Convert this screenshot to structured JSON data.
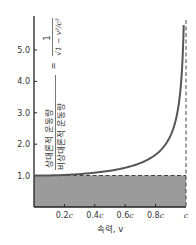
{
  "chart_data": {
    "type": "line",
    "title": "",
    "xlabel": "속력, v",
    "ylabel": {
      "numerator": "상대론적 운동량",
      "denominator": "비상대론적 운동량",
      "formula": "= 1/√(1 − v²/c²)",
      "formula_numerator": "1",
      "formula_denominator": "√1 − v²/c²"
    },
    "x_ticks": [
      {
        "value": 0.2,
        "label": "0.2c"
      },
      {
        "value": 0.4,
        "label": "0.4c"
      },
      {
        "value": 0.6,
        "label": "0.6c"
      },
      {
        "value": 0.8,
        "label": "0.8c"
      },
      {
        "value": 1.0,
        "label": "c"
      }
    ],
    "y_ticks": [
      {
        "value": 1.0,
        "label": "1.0"
      },
      {
        "value": 2.0,
        "label": "2.0"
      },
      {
        "value": 3.0,
        "label": "3.0"
      },
      {
        "value": 4.0,
        "label": "4.0"
      },
      {
        "value": 5.0,
        "label": "5.0"
      }
    ],
    "xlim": [
      0,
      1.0
    ],
    "ylim": [
      0,
      6.0
    ],
    "grid": false,
    "series": [
      {
        "name": "relativistic/nonrelativistic momentum ratio",
        "x": [
          0.0,
          0.1,
          0.2,
          0.3,
          0.4,
          0.5,
          0.6,
          0.7,
          0.8,
          0.85,
          0.9,
          0.93,
          0.95,
          0.97,
          0.98,
          0.985
        ],
        "y": [
          1.0,
          1.005,
          1.021,
          1.048,
          1.091,
          1.155,
          1.25,
          1.4,
          1.667,
          1.898,
          2.294,
          2.72,
          3.203,
          4.113,
          5.025,
          5.8
        ],
        "color": "#555555"
      }
    ],
    "annotations": [
      {
        "type": "hline-dashed",
        "y": 1.0,
        "label": "nonrelativistic ratio = 1"
      },
      {
        "type": "vline-dashed",
        "x": 1.0,
        "label": "speed of light c"
      },
      {
        "type": "shaded-region",
        "y_range": [
          0,
          1.0
        ],
        "x_range": [
          0,
          1.0
        ]
      }
    ]
  },
  "colors": {
    "curve": "#555555",
    "fill": "#9b9b9b",
    "axis": "#222222",
    "dashed": "#444444",
    "text": "#333333"
  }
}
